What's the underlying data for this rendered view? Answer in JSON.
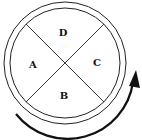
{
  "diagram": {
    "type": "quadrant-circle",
    "quadrants": [
      {
        "position": "top",
        "label": "D"
      },
      {
        "position": "left",
        "label": "A"
      },
      {
        "position": "right",
        "label": "C"
      },
      {
        "position": "bottom",
        "label": "B"
      }
    ],
    "arrow": {
      "direction": "counterclockwise",
      "from": "bottom-left",
      "to": "right"
    },
    "colors": {
      "stroke": "#111111",
      "background": "#ffffff"
    }
  }
}
